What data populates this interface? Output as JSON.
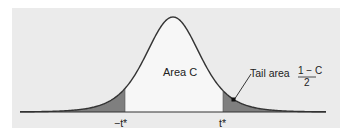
{
  "diagram": {
    "type": "t-distribution density with central confidence area",
    "center_label": "Area C",
    "tail_label_prefix": "Tail area",
    "tail_fraction": {
      "numerator": "1 − C",
      "denominator": "2"
    },
    "critical_values": {
      "left": "−t*",
      "right": "t*"
    },
    "colors": {
      "background_panel": "#ebebeb",
      "center_area": "#f7f7f7",
      "tail_area": "#7f7f7f",
      "curve": "#333333",
      "axis": "#333333"
    }
  },
  "chart_data": {
    "type": "area",
    "title": "",
    "xlabel": "",
    "ylabel": "",
    "x_ticks": [
      "−t*",
      "t*"
    ],
    "regions": [
      {
        "name": "left tail",
        "label": "",
        "shaded": true
      },
      {
        "name": "center",
        "label": "Area C",
        "shaded": false
      },
      {
        "name": "right tail",
        "label": "Tail area (1 − C)/2",
        "shaded": true
      }
    ],
    "grid": false,
    "legend": "none"
  }
}
